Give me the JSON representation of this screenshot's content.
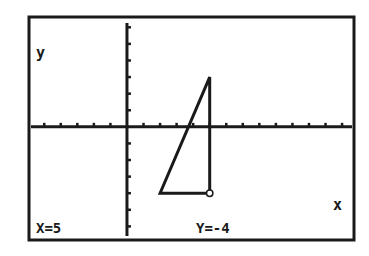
{
  "chart_data": {
    "type": "line",
    "title": "",
    "xlabel": "x",
    "ylabel": "y",
    "grid": false,
    "axes": {
      "x_ticks_spacing": 1,
      "y_ticks_spacing": 1
    },
    "xlim": [
      -5.8,
      13.6
    ],
    "ylim": [
      -6.7,
      6.5
    ],
    "series": [
      {
        "name": "triangle",
        "closed": true,
        "points": [
          {
            "x": 5,
            "y": 3
          },
          {
            "x": 2,
            "y": -4
          },
          {
            "x": 5,
            "y": -4
          }
        ]
      }
    ],
    "trace_cursor": {
      "x": 5,
      "y": -4
    },
    "annotations": [
      {
        "text": "y",
        "position": "upper-left"
      },
      {
        "text": "x",
        "position": "lower-right"
      },
      {
        "text": "X=5",
        "position": "bottom-left"
      },
      {
        "text": "Y=-4",
        "position": "bottom-center"
      }
    ]
  },
  "screen": {
    "axis_label_y": "y",
    "axis_label_x": "x",
    "readout_x": "X=5",
    "readout_y": "Y=-4"
  },
  "colors": {
    "ink": "#1a1a1a",
    "background": "#ffffff"
  }
}
